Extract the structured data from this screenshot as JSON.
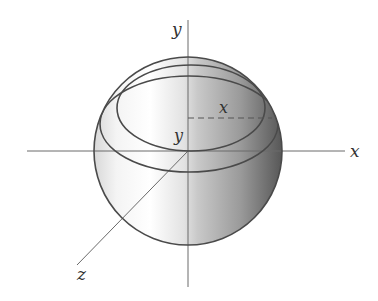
{
  "diagram": {
    "type": "sphere-with-3d-axes",
    "axes": {
      "x_label": "x",
      "y_label": "y",
      "z_label": "z"
    },
    "inner_labels": {
      "radius_label": "x",
      "height_label": "y"
    },
    "colors": {
      "stroke": "#4a4a4a",
      "axis": "#6a6a6a",
      "shade_light": "#ffffff",
      "shade_mid": "#cfcfcf",
      "shade_dark": "#555555"
    }
  }
}
